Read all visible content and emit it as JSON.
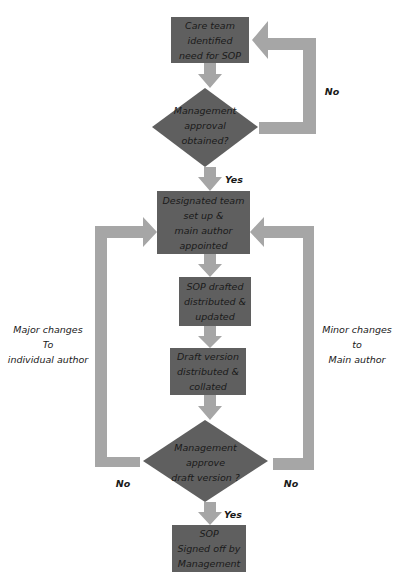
{
  "colors": {
    "node_fill": "#5f5f5f",
    "arrow_fill": "#a6a6a6",
    "text": "#1a1a1a"
  },
  "nodes": [
    {
      "id": "care-team",
      "type": "process",
      "text": "Care team\nidentified\nneed for SOP"
    },
    {
      "id": "mgmt-approval",
      "type": "decision",
      "text": "Management\napproval\nobtained?"
    },
    {
      "id": "designated-team",
      "type": "process",
      "text": "Designated team\nset up &\nmain author\nappointed"
    },
    {
      "id": "sop-drafted",
      "type": "process",
      "text": "SOP drafted\ndistributed &\nupdated"
    },
    {
      "id": "draft-version",
      "type": "process",
      "text": "Draft version\ndistributed &\ncollated"
    },
    {
      "id": "mgmt-approve-draft",
      "type": "decision",
      "text": "Management\napprove\ndraft version ?"
    },
    {
      "id": "sop-signed",
      "type": "process",
      "text": "SOP\nSigned off by\nManagement"
    }
  ],
  "edge_labels": {
    "no_top": "No",
    "yes_top": "Yes",
    "major_changes": "Major changes\nTo\nindividual author",
    "minor_changes": "Minor changes\nto\nMain author",
    "no_left": "No",
    "no_right": "No",
    "yes_bottom": "Yes"
  }
}
